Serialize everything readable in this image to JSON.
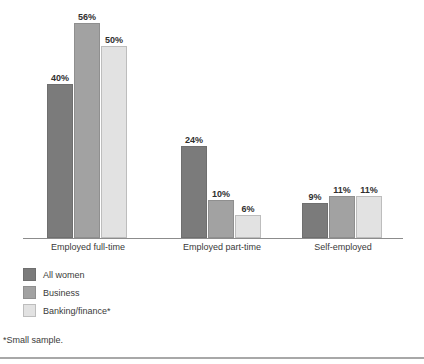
{
  "chart_data": {
    "type": "bar",
    "title": "",
    "subtitle": "",
    "xlabel": "",
    "ylabel": "",
    "ylim": [
      0,
      60
    ],
    "grid": false,
    "legend_position": "bottom-left",
    "value_suffix": "%",
    "categories": [
      "Employed full-time",
      "Employed part-time",
      "Self-employed"
    ],
    "series": [
      {
        "name": "All women",
        "color": "#7b7b7b",
        "values": [
          40,
          24,
          9
        ],
        "labels": [
          "40%",
          "24%",
          "9%"
        ]
      },
      {
        "name": "Business",
        "color": "#a2a2a2",
        "values": [
          56,
          10,
          11
        ],
        "labels": [
          "56%",
          "10%",
          "11%"
        ]
      },
      {
        "name": "Banking/finance*",
        "color": "#e2e2e2",
        "values": [
          50,
          6,
          11
        ],
        "labels": [
          "50%",
          "6%",
          "11%"
        ]
      }
    ],
    "annotations": [
      "*Small sample."
    ]
  },
  "legend": {
    "items": [
      {
        "label": "All women"
      },
      {
        "label": "Business"
      },
      {
        "label": "Banking/finance*"
      }
    ]
  },
  "axis": {
    "categories": [
      {
        "label": "Employed full-time"
      },
      {
        "label": "Employed part-time"
      },
      {
        "label": "Self-employed"
      }
    ]
  },
  "footnote": {
    "text": "*Small sample."
  },
  "values": {
    "g0": {
      "s0": "40%",
      "s1": "56%",
      "s2": "50%"
    },
    "g1": {
      "s0": "24%",
      "s1": "10%",
      "s2": "6%"
    },
    "g2": {
      "s0": "9%",
      "s1": "11%",
      "s2": "11%"
    }
  }
}
